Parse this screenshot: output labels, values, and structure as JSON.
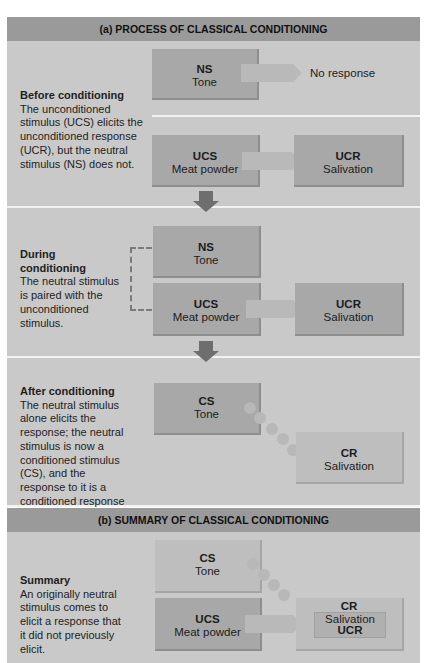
{
  "section_a": {
    "title": "(a) PROCESS OF CLASSICAL CONDITIONING",
    "before": {
      "heading": "Before conditioning",
      "text": "The unconditioned stimulus (UCS) elicits the unconditioned response (UCR), but the neutral stimulus (NS) does not.",
      "ns": {
        "abbr": "NS",
        "name": "Tone"
      },
      "no_response": "No response",
      "ucs": {
        "abbr": "UCS",
        "name": "Meat powder"
      },
      "ucr": {
        "abbr": "UCR",
        "name": "Salivation"
      }
    },
    "during": {
      "heading": "During conditioning",
      "text": "The neutral stimulus is paired with the unconditioned stimulus.",
      "ns": {
        "abbr": "NS",
        "name": "Tone"
      },
      "ucs": {
        "abbr": "UCS",
        "name": "Meat powder"
      },
      "ucr": {
        "abbr": "UCR",
        "name": "Salivation"
      }
    },
    "after": {
      "heading": "After conditioning",
      "text": "The neutral stimulus alone elicits the response; the neutral stimulus is now a conditioned stimulus (CS), and the response to it is a conditioned response (CR).",
      "cs": {
        "abbr": "CS",
        "name": "Tone"
      },
      "cr": {
        "abbr": "CR",
        "name": "Salivation"
      }
    }
  },
  "section_b": {
    "title": "(b) SUMMARY OF CLASSICAL CONDITIONING",
    "summary": {
      "heading": "Summary",
      "text": "An originally neutral stimulus comes to elicit a response that it did not previously elicit.",
      "cs": {
        "abbr": "CS",
        "name": "Tone"
      },
      "ucs": {
        "abbr": "UCS",
        "name": "Meat powder"
      },
      "cr": {
        "abbr": "CR",
        "name": "Salivation",
        "inner_abbr": "UCR"
      }
    }
  }
}
